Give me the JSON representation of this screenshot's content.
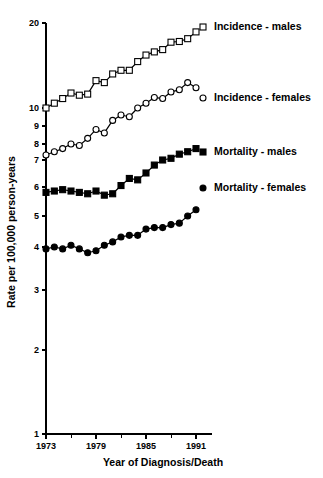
{
  "chart_data": {
    "type": "line",
    "title": "",
    "xlabel": "Year of Diagnosis/Death",
    "ylabel": "Rate per 100,000 person-years",
    "yscale": "log",
    "ylim": [
      1,
      20
    ],
    "xlim": [
      1973,
      1991
    ],
    "grid": false,
    "legend_position": "right-inline",
    "y_ticks": [
      1,
      2,
      3,
      4,
      5,
      6,
      7,
      8,
      9,
      10,
      20
    ],
    "y_tick_labels": [
      "1",
      "2",
      "3",
      "4",
      "5",
      "6",
      "7",
      "8",
      "9",
      "10",
      "20"
    ],
    "x_ticks": [
      1973,
      1976,
      1979,
      1982,
      1985,
      1988,
      1991
    ],
    "x_tick_labels": [
      "1973",
      "",
      "1979",
      "",
      "1985",
      "",
      "1991"
    ],
    "x_labeled_ticks": [
      1973,
      1979,
      1985,
      1991
    ],
    "x": [
      1973,
      1974,
      1975,
      1976,
      1977,
      1978,
      1979,
      1980,
      1981,
      1982,
      1983,
      1984,
      1985,
      1986,
      1987,
      1988,
      1989,
      1990,
      1991
    ],
    "series": [
      {
        "name": "Incidence - males",
        "marker": "open-square",
        "color": "#000000",
        "values": [
          10.0,
          10.4,
          10.8,
          11.3,
          11.1,
          11.2,
          12.5,
          12.3,
          13.2,
          13.6,
          13.6,
          14.6,
          15.4,
          15.8,
          16.1,
          17.1,
          17.2,
          17.6,
          18.6
        ]
      },
      {
        "name": "Incidence - females",
        "marker": "open-circle",
        "color": "#000000",
        "values": [
          7.3,
          7.5,
          7.7,
          8.0,
          7.9,
          8.3,
          8.8,
          8.6,
          9.3,
          9.6,
          9.5,
          10.0,
          10.4,
          10.9,
          10.8,
          11.4,
          11.6,
          12.3,
          11.8
        ]
      },
      {
        "name": "Mortality - males",
        "marker": "filled-square",
        "color": "#000000",
        "values": [
          5.8,
          5.85,
          5.9,
          5.85,
          5.8,
          5.75,
          5.85,
          5.7,
          5.75,
          6.05,
          6.3,
          6.25,
          6.5,
          6.8,
          7.0,
          7.1,
          7.35,
          7.5,
          7.7
        ]
      },
      {
        "name": "Mortality - females",
        "marker": "filled-circle",
        "color": "#000000",
        "values": [
          3.95,
          4.0,
          3.95,
          4.05,
          3.95,
          3.85,
          3.9,
          4.05,
          4.15,
          4.3,
          4.35,
          4.35,
          4.55,
          4.6,
          4.6,
          4.7,
          4.75,
          5.0,
          5.2
        ]
      }
    ],
    "legend": [
      {
        "label": "Incidence - males",
        "marker": "open-square"
      },
      {
        "label": "Incidence - females",
        "marker": "open-circle"
      },
      {
        "label": "Mortality - males",
        "marker": "filled-square"
      },
      {
        "label": "Mortality - females",
        "marker": "filled-circle"
      }
    ]
  }
}
